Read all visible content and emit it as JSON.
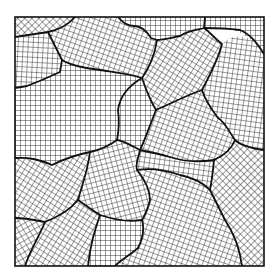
{
  "figure": {
    "title": "",
    "frame": {
      "x": 15,
      "y": 17,
      "width": 249,
      "height": 249
    },
    "colors": {
      "background": "#ffffff",
      "lines": "#1a1a1a",
      "boundary": "#111111"
    },
    "grid_spacing_px": 5,
    "grain_count": 16
  }
}
